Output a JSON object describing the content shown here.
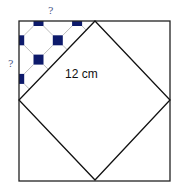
{
  "figure": {
    "outer_square": {
      "x": 19,
      "y": 21,
      "size": 151,
      "stroke": "#222222"
    },
    "inner_diamond": {
      "top": [
        95,
        21
      ],
      "right": [
        170,
        100
      ],
      "bottom": [
        95,
        180
      ],
      "left": [
        19,
        100
      ],
      "stroke": "#111111"
    },
    "tile_pattern": {
      "square_color": "#0d1a6b",
      "line_color": "#bbbbbb",
      "square_size": 10,
      "grid_step": 19.3,
      "origin": [
        38.5,
        21
      ]
    },
    "labels": {
      "top_unknown": "?",
      "left_unknown": "?",
      "diagonal_length": "12 cm"
    }
  }
}
